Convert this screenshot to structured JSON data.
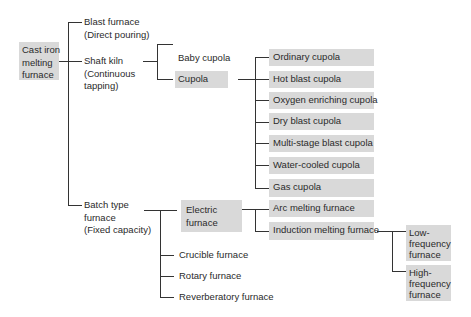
{
  "diagram": {
    "root": {
      "label_lines": [
        "Cast iron",
        "melting",
        "furnace"
      ]
    },
    "level1": [
      {
        "label_lines": [
          "Blast furnace",
          "(Direct pouring)"
        ]
      },
      {
        "label_lines": [
          "Shaft kiln",
          "(Continuous",
          "tapping)"
        ]
      },
      {
        "label_lines": [
          "Batch type",
          "furnace",
          "(Fixed capacity)"
        ]
      }
    ],
    "shaft_children": [
      {
        "label": "Baby cupola"
      },
      {
        "label": "Cupola"
      }
    ],
    "cupola_children": [
      {
        "label": "Ordinary cupola"
      },
      {
        "label": "Hot blast cupola"
      },
      {
        "label": "Oxygen enriching cupola"
      },
      {
        "label": "Dry blast cupola"
      },
      {
        "label": "Multi-stage blast cupola"
      },
      {
        "label": "Water-cooled cupola"
      },
      {
        "label": "Gas cupola"
      }
    ],
    "batch_children": [
      {
        "label_lines": [
          "Electric",
          "furnace"
        ]
      },
      {
        "label": "Crucible furnace"
      },
      {
        "label": "Rotary furnace"
      },
      {
        "label": "Reverberatory furnace"
      }
    ],
    "electric_children": [
      {
        "label": "Arc melting furnace"
      },
      {
        "label": "Induction melting furnace"
      }
    ],
    "induction_children": [
      {
        "label_lines": [
          "Low-",
          "frequency",
          "furnace"
        ]
      },
      {
        "label_lines": [
          "High-",
          "frequency",
          "furnace"
        ]
      }
    ],
    "colors": {
      "box_fill": "#d9d9d9",
      "line": "#333333",
      "text": "#2a2a2a"
    }
  }
}
